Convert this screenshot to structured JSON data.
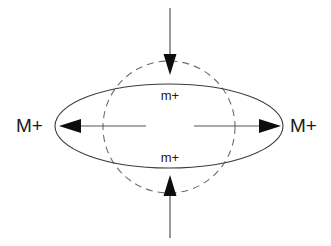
{
  "figure": {
    "canvas": {
      "width": 331,
      "height": 246,
      "background": "#ffffff"
    },
    "labels": {
      "left_major": "M+",
      "right_major": "M+",
      "top_minor": "m+",
      "bottom_minor": "m+"
    },
    "shapes": {
      "solid_ellipse": {
        "name": "solid-ellipse",
        "cx": 169,
        "cy": 126,
        "rx": 114,
        "ry": 42,
        "stroke": "#3c3c3c",
        "style": "solid"
      },
      "dashed_circle": {
        "name": "dashed-circle",
        "cx": 169,
        "cy": 127,
        "r": 66,
        "stroke": "#6e6e6e",
        "style": "dashed"
      }
    },
    "arrows": [
      {
        "name": "arrow-top-inward",
        "direction": "down",
        "from_x": 170,
        "from_y": 8,
        "to_x": 170,
        "to_y": 74,
        "color": "#0d0d0d"
      },
      {
        "name": "arrow-bottom-inward",
        "direction": "up",
        "from_x": 170,
        "from_y": 238,
        "to_x": 170,
        "to_y": 176,
        "color": "#0d0d0d"
      },
      {
        "name": "arrow-left-outward",
        "direction": "left",
        "from_x": 146,
        "from_y": 126,
        "to_x": 60,
        "to_y": 126,
        "color": "#0d0d0d"
      },
      {
        "name": "arrow-right-outward",
        "direction": "right",
        "from_x": 194,
        "from_y": 126,
        "to_x": 280,
        "to_y": 126,
        "color": "#0d0d0d"
      }
    ],
    "label_positions": {
      "left_major": {
        "x": 16,
        "y": 126
      },
      "right_major": {
        "x": 292,
        "y": 126
      },
      "top_minor": {
        "x": 170,
        "y": 96
      },
      "bottom_minor": {
        "x": 170,
        "y": 160
      }
    },
    "colors": {
      "text": "#1a1a1a",
      "solid_stroke": "#3c3c3c",
      "dashed_stroke": "#6e6e6e",
      "arrow_fill": "#0d0d0d",
      "shaft_stroke": "#555555"
    }
  }
}
